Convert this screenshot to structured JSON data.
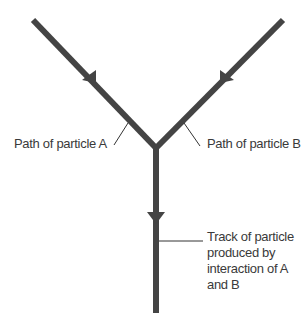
{
  "diagram": {
    "colors": {
      "track": "#444444",
      "leader": "#333333",
      "text": "#3a3a3a"
    },
    "labels": {
      "particle_a": "Path of particle A",
      "particle_b": "Path of particle B",
      "track_lines": [
        "Track of particle",
        "produced by",
        "interaction of A",
        "and B"
      ]
    }
  }
}
